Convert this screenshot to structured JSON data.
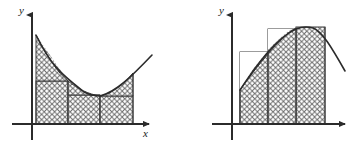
{
  "figure": {
    "title": "",
    "background_color": "#ffffff",
    "stroke_color": "#2b2b2b",
    "hatch_color": "#6e6e6e",
    "width": 348,
    "height": 147,
    "panels": [
      {
        "name": "left-panel",
        "description": "Lower sums: rectangles inscribed under a convex curve (decreasing then increasing)",
        "axes": {
          "x_axis_label": "x",
          "y_axis_label": "y",
          "x_axis_y": 124,
          "y_axis_x": 32,
          "x_axis_start": 12,
          "x_axis_end": 152,
          "y_axis_top": 12,
          "y_axis_bottom": 140,
          "x_label_pos": [
            146,
            136
          ],
          "y_label_pos": [
            19,
            14
          ]
        },
        "curve": {
          "type": "convex-parabola",
          "points": [
            [
              36,
              35
            ],
            [
              44,
              50
            ],
            [
              52,
              62
            ],
            [
              60,
              72
            ],
            [
              68,
              81
            ],
            [
              76,
              87
            ],
            [
              84,
              92
            ],
            [
              92,
              95
            ],
            [
              100,
              96
            ],
            [
              108,
              94
            ],
            [
              116,
              89
            ],
            [
              124,
              82
            ],
            [
              132,
              74
            ],
            [
              140,
              66
            ],
            [
              152,
              55
            ]
          ]
        },
        "rectangles": [
          {
            "x0": 36,
            "x1": 68,
            "top": 81,
            "bottom": 124
          },
          {
            "x0": 68,
            "x1": 100,
            "top": 95,
            "bottom": 124
          },
          {
            "x0": 100,
            "x1": 133,
            "top": 96,
            "bottom": 124
          }
        ],
        "partition_x": [
          36,
          68,
          100,
          133
        ]
      },
      {
        "name": "right-panel",
        "description": "Upper sums: rectangles circumscribed over a concave curve (increasing to a peak)",
        "axes": {
          "x_axis_label": "",
          "y_axis_label": "y",
          "x_axis_y": 124,
          "y_axis_x": 232,
          "x_axis_start": 212,
          "x_axis_end": 347,
          "y_axis_top": 12,
          "y_axis_bottom": 140,
          "x_label_pos": [
            341,
            136
          ],
          "y_label_pos": [
            219,
            14
          ]
        },
        "curve": {
          "type": "concave-parabola",
          "points": [
            [
              240,
              88
            ],
            [
              248,
              76
            ],
            [
              256,
              65
            ],
            [
              264,
              55
            ],
            [
              272,
              46
            ],
            [
              280,
              39
            ],
            [
              288,
              33
            ],
            [
              296,
              29
            ],
            [
              304,
              27
            ],
            [
              312,
              27
            ],
            [
              320,
              30
            ],
            [
              328,
              38
            ],
            [
              336,
              52
            ],
            [
              345,
              70
            ]
          ]
        },
        "rectangles": [
          {
            "x0": 240,
            "x1": 268,
            "top": 52,
            "bottom": 124
          },
          {
            "x0": 268,
            "x1": 296,
            "top": 29,
            "bottom": 124
          },
          {
            "x0": 296,
            "x1": 325,
            "top": 27,
            "bottom": 124
          }
        ],
        "partition_x": [
          240,
          268,
          296,
          325
        ]
      }
    ]
  }
}
